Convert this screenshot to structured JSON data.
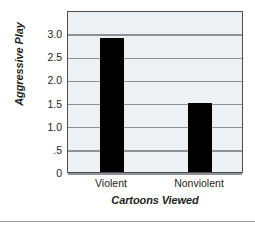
{
  "chart_data": {
    "type": "bar",
    "title": "",
    "categories": [
      "Violent",
      "Nonviolent"
    ],
    "values": [
      2.9,
      1.5
    ],
    "xlabel": "Cartoons Viewed",
    "ylabel": "Aggressive Play",
    "ylim": [
      0,
      3.5
    ],
    "ytick_values": [
      0,
      0.5,
      1.0,
      1.5,
      2.0,
      2.5,
      3.0
    ],
    "ytick_labels": [
      "0",
      ".5",
      "1.0",
      "1.5",
      "2.0",
      "2.5",
      "3.0"
    ],
    "grid": true,
    "legend": null,
    "bar_color": "#000000",
    "plot_background": "#eef1f3",
    "gridline_color": "#8d9295",
    "frame_color": "#4b4f52"
  },
  "axes": {
    "y_title": "Aggressive Play",
    "x_title": "Cartoons Viewed"
  },
  "bars": [
    {
      "label": "Violent",
      "value": 2.9
    },
    {
      "label": "Nonviolent",
      "value": 1.5
    }
  ]
}
